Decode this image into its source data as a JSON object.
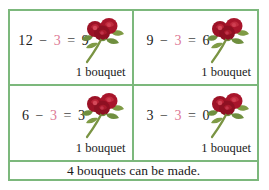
{
  "worksheet": {
    "title": "Repeated subtraction bouquet worksheet",
    "border_color": "#7cb87c",
    "text_color": "#1a1a1a",
    "subtrahend_color": "#dd7a96",
    "rose_color": "#a8152b",
    "leaf_color": "#6f8f3f",
    "cells": [
      {
        "minuend": "12",
        "operator": "−",
        "subtrahend": "3",
        "equals": "=",
        "result": "9",
        "label": "1 bouquet",
        "icon": "rose-bouquet-icon"
      },
      {
        "minuend": "9",
        "operator": "−",
        "subtrahend": "3",
        "equals": "=",
        "result": "6",
        "label": "1 bouquet",
        "icon": "rose-bouquet-icon"
      },
      {
        "minuend": "6",
        "operator": "−",
        "subtrahend": "3",
        "equals": "=",
        "result": "3",
        "label": "1 bouquet",
        "icon": "rose-bouquet-icon"
      },
      {
        "minuend": "3",
        "operator": "−",
        "subtrahend": "3",
        "equals": "=",
        "result": "0",
        "label": "1 bouquet",
        "icon": "rose-bouquet-icon"
      }
    ],
    "footer": {
      "text": "4 bouquets can be made."
    }
  }
}
